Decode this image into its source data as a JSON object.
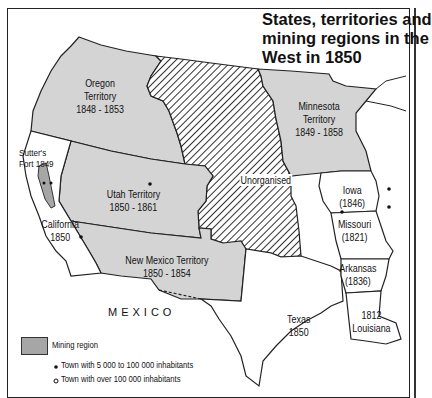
{
  "title": [
    "States, territories and",
    "mining regions in the",
    "West in 1850"
  ],
  "regions": {
    "oregon": {
      "name": "Oregon",
      "type": "Territory",
      "years": "1848 - 1853"
    },
    "minnesota": {
      "name": "Minnesota",
      "type": "Territory",
      "years": "1849 - 1858"
    },
    "utah": {
      "name": "Utah Territory",
      "years": "1850 - 1861"
    },
    "new_mexico": {
      "name": "New Mexico Territory",
      "years": "1850 - 1854"
    },
    "california": {
      "name": "California",
      "years": "1850"
    },
    "unorganised": {
      "name": "Unorganised"
    },
    "iowa": {
      "name": "Iowa",
      "years": "(1846)"
    },
    "missouri": {
      "name": "Missouri",
      "years": "(1821)"
    },
    "arkansas": {
      "name": "Arkansas",
      "years": "(1836)"
    },
    "texas": {
      "name": "Texas",
      "years": "1850"
    },
    "louisiana": {
      "name": "Louisiana",
      "years": "1812"
    },
    "sutters_fort": {
      "name": "Sutter's",
      "years": "Fort 1849"
    },
    "mexico": {
      "name": "MEXICO"
    }
  },
  "legend": {
    "mining": "Mining region",
    "town_small": "Town with 5 000 to 100 000 inhabitants",
    "town_large": "Town with over 100 000 inhabitants"
  },
  "colors": {
    "territory_fill": "#d4d4d4",
    "mining_fill": "#a6a6a6",
    "hatch": "#333333",
    "border": "#222222"
  }
}
